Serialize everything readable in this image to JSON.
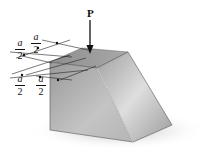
{
  "figure": {
    "load_label": "P",
    "dimensions": [
      {
        "numerator": "a",
        "denominator": "2"
      },
      {
        "numerator": "a",
        "denominator": "2"
      },
      {
        "numerator": "a",
        "denominator": "2"
      },
      {
        "numerator": "a",
        "denominator": "2"
      }
    ],
    "colors": {
      "block_light": "#d8d8d8",
      "block_mid": "#a9a9a9",
      "block_dark": "#7a7a7a",
      "shadow": "#c8c8c8",
      "ink": "#111111"
    }
  }
}
